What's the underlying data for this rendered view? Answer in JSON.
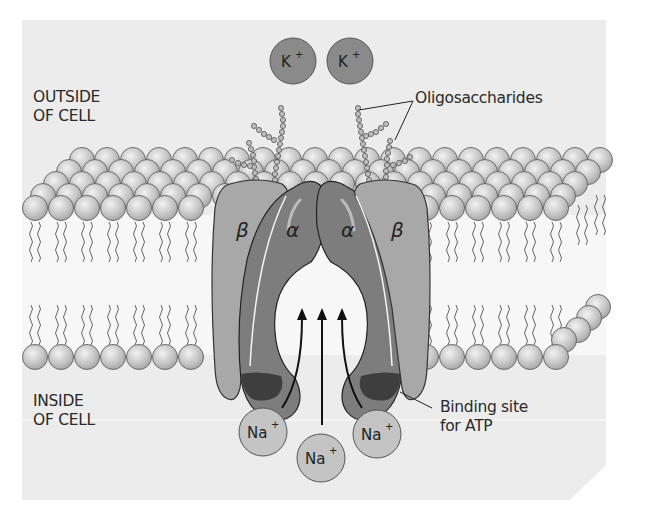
{
  "diagram": {
    "labels": {
      "outside_line1": "OUTSIDE",
      "outside_line2": "OF CELL",
      "inside_line1": "INSIDE",
      "inside_line2": "OF CELL",
      "oligosaccharides": "Oligosaccharides",
      "binding_line1": "Binding site",
      "binding_line2": "for ATP"
    },
    "subunits": {
      "alpha": "α",
      "beta": "β"
    },
    "ions": {
      "potassium": [
        {
          "symbol": "K",
          "charge": "+"
        },
        {
          "symbol": "K",
          "charge": "+"
        }
      ],
      "sodium": [
        {
          "symbol": "Na",
          "charge": "+"
        },
        {
          "symbol": "Na",
          "charge": "+"
        },
        {
          "symbol": "Na",
          "charge": "+"
        }
      ]
    },
    "colors": {
      "background": "#ececec",
      "head": "#c8c8c8",
      "alpha": "#7d7d7d",
      "beta": "#a8a8a8",
      "atp_site": "#3e3e3e",
      "k_ion": "#8a8a8a",
      "na_ion": "#c4c4c4"
    }
  }
}
